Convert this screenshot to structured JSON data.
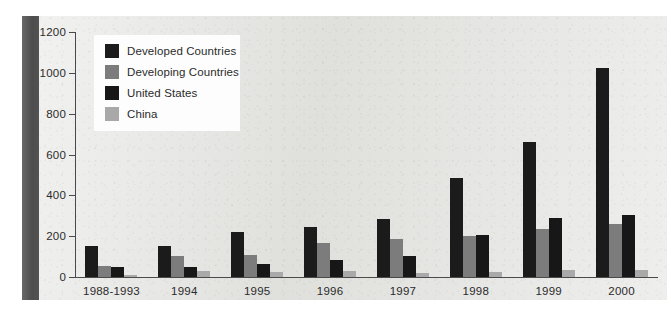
{
  "chart_data": {
    "type": "bar",
    "title": "",
    "xlabel": "",
    "ylabel": "",
    "ylim": [
      0,
      1200
    ],
    "yticks": [
      0,
      200,
      400,
      600,
      800,
      1000,
      1200
    ],
    "ytick_labels": [
      "0",
      "200",
      "400",
      "600",
      "800",
      "1000",
      "1200"
    ],
    "grid": false,
    "legend_position": "upper-left-inside",
    "categories": [
      "1988-1993",
      "1994",
      "1995",
      "1996",
      "1997",
      "1998",
      "1999",
      "2000"
    ],
    "series": [
      {
        "name": "Developed Countries",
        "color": "#1b1b1b",
        "values": [
          150,
          150,
          222,
          245,
          285,
          483,
          663,
          1023
        ]
      },
      {
        "name": "Developing Countries",
        "color": "#7c7c7c",
        "values": [
          55,
          105,
          110,
          165,
          185,
          200,
          235,
          258
        ]
      },
      {
        "name": "United States",
        "color": "#171717",
        "values": [
          50,
          48,
          65,
          85,
          105,
          208,
          290,
          303
        ]
      },
      {
        "name": "China",
        "color": "#a9a9a9",
        "values": [
          12,
          28,
          25,
          28,
          20,
          25,
          35,
          35
        ]
      }
    ]
  },
  "legend": {
    "items": [
      {
        "label": "Developed Countries",
        "color": "#1b1b1b"
      },
      {
        "label": "Developing Countries",
        "color": "#7c7c7c"
      },
      {
        "label": "United States",
        "color": "#171717"
      },
      {
        "label": "China",
        "color": "#a9a9a9"
      }
    ]
  },
  "colors": {
    "panel_background": "#e3e3e0",
    "left_band": "#575757",
    "axis": "#4a4a4a",
    "text": "#2b2b2b",
    "legend_background": "#fdfdfd"
  }
}
